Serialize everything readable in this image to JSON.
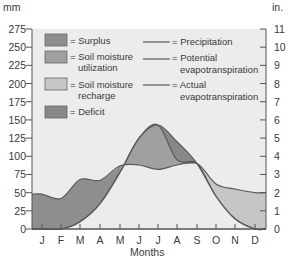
{
  "chart_data": {
    "type": "area",
    "title": "",
    "xlabel": "Months",
    "ylabel_left": "mm",
    "ylabel_right": "in.",
    "categories": [
      "J",
      "F",
      "M",
      "A",
      "M",
      "J",
      "J",
      "A",
      "S",
      "O",
      "N",
      "D"
    ],
    "left_axis": {
      "ticks": [
        0,
        25,
        50,
        75,
        100,
        125,
        150,
        175,
        200,
        225,
        250,
        275
      ],
      "ylim": [
        0,
        275
      ],
      "unit": "mm"
    },
    "right_axis": {
      "ticks": [
        0,
        1,
        2,
        3,
        4,
        5,
        6,
        7,
        8,
        9,
        10,
        11
      ],
      "ylim": [
        0,
        11
      ],
      "unit": "in."
    },
    "grid": false,
    "series": [
      {
        "name": "Precipitation",
        "type": "line",
        "values": [
          48,
          42,
          68,
          67,
          87,
          88,
          82,
          88,
          90,
          62,
          55,
          50
        ]
      },
      {
        "name": "Potential evapotranspiration",
        "type": "line",
        "values": [
          0,
          0,
          10,
          35,
          78,
          125,
          143,
          120,
          90,
          45,
          14,
          0
        ]
      },
      {
        "name": "Actual evapotranspiration",
        "type": "line",
        "values": [
          0,
          0,
          10,
          35,
          78,
          125,
          143,
          95,
          90,
          45,
          14,
          0
        ]
      }
    ],
    "areas": [
      {
        "name": "Surplus",
        "color": "#8c8c8c",
        "description": "precipitation above evapotranspiration, Jan-May"
      },
      {
        "name": "Soil moisture utilization",
        "color": "#9a9a9a",
        "description": "between precipitation and actual ET, Jun-Aug"
      },
      {
        "name": "Soil moisture recharge",
        "color": "#c4c4c4",
        "description": "precipitation above ET, Sep-Dec"
      },
      {
        "name": "Deficit",
        "color": "#858585",
        "description": "between actual and potential ET, Jul-Sep"
      }
    ],
    "legend": {
      "areas": [
        "= Surplus",
        "= Soil moisture utilization",
        "= Soil moisture recharge",
        "= Deficit"
      ],
      "lines": [
        "= Precipitation",
        "= Potential evapotranspiration",
        "= Actual evapotranspiration"
      ],
      "position": "upper inside"
    }
  },
  "labels": {
    "y_left_unit": "mm",
    "y_right_unit": "in.",
    "x_title": "Months",
    "legend_surplus": "= Surplus",
    "legend_util_1": "= Soil moisture",
    "legend_util_2": "utilization",
    "legend_recharge_1": "= Soil moisture",
    "legend_recharge_2": "recharge",
    "legend_deficit": "= Deficit",
    "legend_precip": "= Precipitation",
    "legend_pet_1": "= Potential",
    "legend_pet_2": "evapotranspiration",
    "legend_aet_1": "= Actual",
    "legend_aet_2": "evapotranspiration"
  },
  "colors": {
    "plot_bg": "#ececec",
    "surplus": "#8e8e8e",
    "utilization": "#a0a0a0",
    "recharge": "#c6c6c6",
    "deficit": "#888888",
    "line": "#5a5a5a",
    "axis": "#555555"
  }
}
